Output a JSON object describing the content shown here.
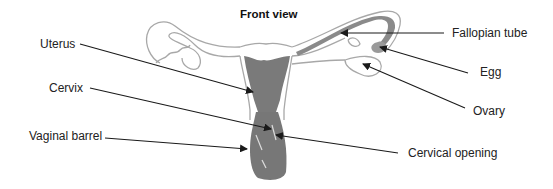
{
  "title": "Front view",
  "labels": {
    "uterus": "Uterus",
    "cervix": "Cervix",
    "vaginal_barrel": "Vaginal barrel",
    "fallopian_tube": "Fallopian tube",
    "egg": "Egg",
    "ovary": "Ovary",
    "cervical_opening": "Cervical opening"
  },
  "colors": {
    "outline": "#b0b0b0",
    "fill": "#7a7a7a",
    "arrow": "#1a1a1a",
    "text": "#222222"
  }
}
